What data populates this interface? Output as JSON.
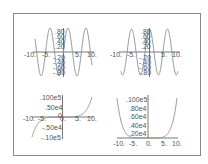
{
  "colors": {
    "frame": "#8a8a8a",
    "axis": "#555555",
    "curve": "#8c8c8c",
    "background": "#ffffff"
  },
  "chart_data": [
    {
      "type": "line",
      "position": "top-left",
      "title": "",
      "xlabel": "",
      "ylabel": "",
      "xlim": [
        -10,
        10
      ],
      "ylim": [
        -1,
        1
      ],
      "x_ticks": [
        "-10.",
        "-5.",
        "5.",
        "10."
      ],
      "y_ticks": [
        ".80",
        ".60",
        ".40",
        ".20",
        "-.20",
        "-.40",
        "-.60",
        "-.80"
      ],
      "series": [
        {
          "name": "sin(x)",
          "function": "sin(x)"
        }
      ],
      "grid": false
    },
    {
      "type": "line",
      "position": "top-right",
      "title": "",
      "xlabel": "",
      "ylabel": "",
      "xlim": [
        -10,
        10
      ],
      "ylim": [
        -1,
        1
      ],
      "x_ticks": [
        "-10.",
        "-5.",
        "5.",
        "10."
      ],
      "y_ticks": [
        ".80",
        ".60",
        ".40",
        ".20",
        "-.20",
        "-.40",
        "-.60",
        "-.80"
      ],
      "series": [
        {
          "name": "cos(x)",
          "function": "cos(x)"
        }
      ],
      "grid": false
    },
    {
      "type": "line",
      "position": "bottom-left",
      "title": "",
      "xlabel": "",
      "ylabel": "",
      "xlim": [
        -10,
        10
      ],
      "ylim": [
        -10000,
        10000
      ],
      "x_ticks": [
        "-10.",
        "-5.",
        "0.",
        "5.",
        "10."
      ],
      "y_ticks": [
        ".100e5",
        ".50e4",
        "0",
        "-.50e4",
        "-.10e5"
      ],
      "series": [
        {
          "name": "x^5/10",
          "function": "odd power curve"
        }
      ],
      "grid": false
    },
    {
      "type": "line",
      "position": "bottom-right",
      "title": "",
      "xlabel": "",
      "ylabel": "",
      "xlim": [
        -10,
        10
      ],
      "ylim": [
        0,
        10000
      ],
      "x_ticks": [
        "-10.",
        "-5.",
        "0.",
        "5.",
        "10."
      ],
      "y_ticks": [
        ".100e5",
        ".80e4",
        ".60e4",
        ".40e4",
        ".20e4"
      ],
      "series": [
        {
          "name": "x^6/100",
          "function": "even power curve"
        }
      ],
      "grid": false
    }
  ],
  "labels": {
    "tl": {
      "x": [
        "-10.",
        "-5.",
        "5.",
        "10."
      ],
      "y": [
        ".80",
        ".60",
        ".40",
        ".20",
        "-.20",
        "-.40",
        "-.60",
        "-.80"
      ]
    },
    "tr": {
      "x": [
        "-10.",
        "-5.",
        "5.",
        "10."
      ],
      "y": [
        ".80",
        ".60",
        ".40",
        ".20",
        "-.20",
        "-.40",
        "-.60",
        "-.80"
      ]
    },
    "bl": {
      "x": [
        "-10.",
        "-5.",
        "0.",
        "5.",
        "10."
      ],
      "y": [
        ".100e5",
        ".50e4",
        "0",
        "-.50e4",
        "-.10e5"
      ]
    },
    "br": {
      "x": [
        "-10.",
        "-5.",
        "0.",
        "5.",
        "10."
      ],
      "y": [
        ".100e5",
        ".80e4",
        ".60e4",
        ".40e4",
        ".20e4"
      ]
    }
  }
}
